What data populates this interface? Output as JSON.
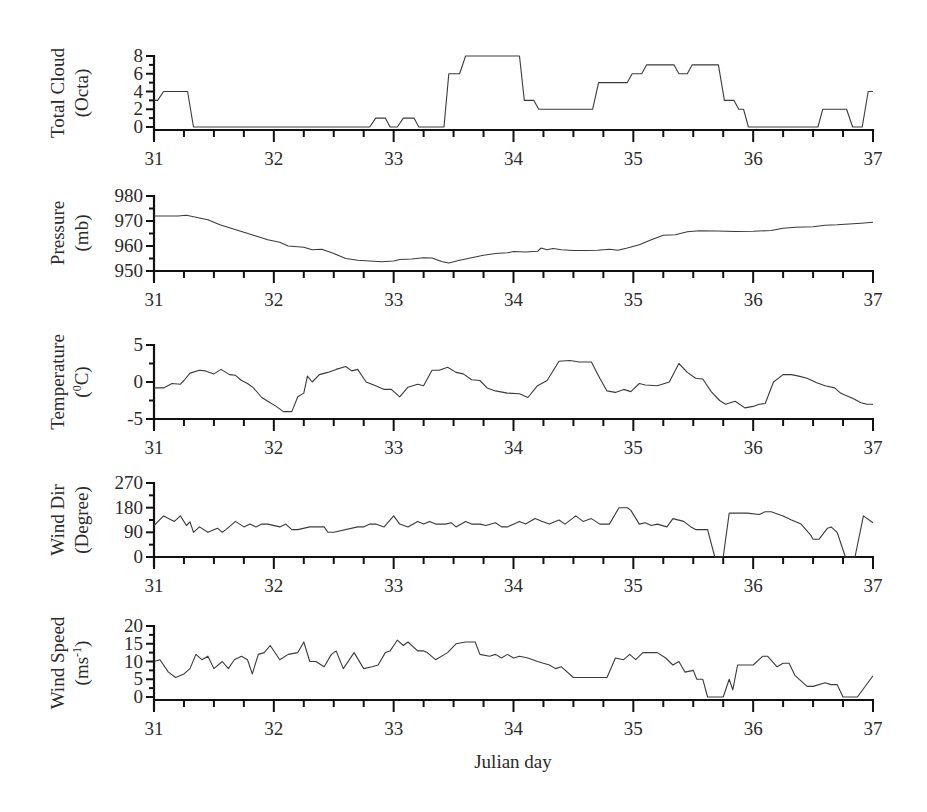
{
  "figure": {
    "xlabel": "Julian day"
  },
  "chart_data": [
    {
      "type": "line",
      "title": "",
      "ylabel_line1": "Total Cloud",
      "ylabel_line2": "(Octa)",
      "xlabel": "",
      "xlim": [
        31,
        37
      ],
      "ylim": [
        0,
        8
      ],
      "yticks": [
        0,
        2,
        4,
        6,
        8
      ],
      "xticks": [
        31,
        32,
        33,
        34,
        35,
        36,
        37
      ],
      "grid": false,
      "series": [
        {
          "name": "Total Cloud",
          "x": [
            31.0,
            31.03,
            31.08,
            31.28,
            31.33,
            32.8,
            32.85,
            32.93,
            32.97,
            33.03,
            33.08,
            33.17,
            33.21,
            33.42,
            33.46,
            33.55,
            33.6,
            34.05,
            34.09,
            34.17,
            34.21,
            34.66,
            34.71,
            34.95,
            34.99,
            35.07,
            35.11,
            35.34,
            35.38,
            35.45,
            35.49,
            35.71,
            35.76,
            35.84,
            35.88,
            35.92,
            35.96,
            36.54,
            36.58,
            36.78,
            36.83,
            36.91,
            36.96,
            37.0
          ],
          "values": [
            3,
            3,
            4,
            4,
            0,
            0,
            1,
            1,
            0,
            0,
            1,
            1,
            0,
            0,
            6,
            6,
            8,
            8,
            3,
            3,
            2,
            2,
            5,
            5,
            6,
            6,
            7,
            7,
            6,
            6,
            7,
            7,
            3,
            3,
            2,
            2,
            0,
            0,
            2,
            2,
            0,
            0,
            4,
            4
          ]
        }
      ]
    },
    {
      "type": "line",
      "title": "",
      "ylabel_line1": "Pressure",
      "ylabel_line2": "(mb)",
      "xlabel": "",
      "xlim": [
        31,
        37
      ],
      "ylim": [
        950,
        980
      ],
      "yticks": [
        950,
        960,
        970,
        980
      ],
      "xticks": [
        31,
        32,
        33,
        34,
        35,
        36,
        37
      ],
      "grid": false,
      "series": [
        {
          "name": "Pressure",
          "x": [
            31.0,
            31.1,
            31.2,
            31.27,
            31.35,
            31.45,
            31.55,
            31.65,
            31.75,
            31.85,
            31.95,
            32.05,
            32.12,
            32.25,
            32.32,
            32.4,
            32.5,
            32.6,
            32.7,
            32.8,
            32.9,
            33.0,
            33.05,
            33.15,
            33.25,
            33.32,
            33.4,
            33.46,
            33.55,
            33.65,
            33.75,
            33.85,
            33.95,
            34.0,
            34.1,
            34.2,
            34.23,
            34.28,
            34.33,
            34.4,
            34.5,
            34.6,
            34.7,
            34.8,
            34.87,
            34.95,
            35.05,
            35.15,
            35.25,
            35.35,
            35.45,
            35.55,
            35.7,
            35.85,
            36.0,
            36.15,
            36.25,
            36.35,
            36.5,
            36.6,
            36.7,
            36.8,
            36.9,
            37.0
          ],
          "values": [
            972,
            972,
            972,
            972.3,
            971.5,
            970.5,
            968.5,
            967,
            965.5,
            964,
            962.5,
            961.5,
            960,
            959.5,
            958.5,
            958.7,
            957,
            955,
            954.3,
            954,
            953.7,
            954,
            954.6,
            954.8,
            955.3,
            955.2,
            953.8,
            953.2,
            954.3,
            955.3,
            956.3,
            957,
            957.3,
            957.8,
            957.6,
            957.9,
            959.2,
            958.5,
            959,
            958.5,
            958.2,
            958.2,
            958.3,
            958.7,
            958.3,
            959.2,
            960.5,
            962.5,
            964.3,
            964.5,
            965.7,
            966.1,
            966,
            965.8,
            965.9,
            966.2,
            967.1,
            967.5,
            967.7,
            968.3,
            968.5,
            968.8,
            969.1,
            969.5
          ]
        }
      ]
    },
    {
      "type": "line",
      "title": "",
      "ylabel_line1": "Temperature",
      "ylabel_line2": "(0C)",
      "ylabel_line2_parts": {
        "open": "(",
        "sup": "0",
        "rest": "C)"
      },
      "xlabel": "",
      "xlim": [
        31,
        37
      ],
      "ylim": [
        -5,
        5
      ],
      "yticks": [
        -5,
        0,
        5
      ],
      "ytick_labels": [
        "-5",
        "0",
        "5"
      ],
      "xticks": [
        31,
        32,
        33,
        34,
        35,
        36,
        37
      ],
      "grid": false,
      "series": [
        {
          "name": "Temperature",
          "x": [
            31.0,
            31.08,
            31.15,
            31.22,
            31.25,
            31.3,
            31.38,
            31.43,
            31.5,
            31.56,
            31.63,
            31.68,
            31.73,
            31.78,
            31.83,
            31.9,
            31.95,
            32.02,
            32.08,
            32.15,
            32.2,
            32.25,
            32.28,
            32.32,
            32.38,
            32.45,
            32.52,
            32.6,
            32.65,
            32.7,
            32.77,
            32.85,
            32.92,
            32.98,
            33.05,
            33.12,
            33.2,
            33.25,
            33.32,
            33.38,
            33.45,
            33.52,
            33.58,
            33.65,
            33.72,
            33.78,
            33.85,
            33.95,
            34.05,
            34.12,
            34.2,
            34.28,
            34.38,
            34.47,
            34.55,
            34.65,
            34.72,
            34.78,
            34.85,
            34.92,
            34.98,
            35.05,
            35.1,
            35.2,
            35.3,
            35.38,
            35.45,
            35.52,
            35.58,
            35.65,
            35.72,
            35.77,
            35.85,
            35.93,
            36.0,
            36.05,
            36.1,
            36.17,
            36.25,
            36.32,
            36.38,
            36.45,
            36.53,
            36.6,
            36.68,
            36.73,
            36.77,
            36.83,
            36.9,
            36.95,
            37.0
          ],
          "values": [
            -0.8,
            -0.8,
            -0.2,
            -0.3,
            0.2,
            1.2,
            1.6,
            1.5,
            1.1,
            1.7,
            1.0,
            0.9,
            0.2,
            -0.2,
            -0.8,
            -2.1,
            -2.6,
            -3.3,
            -4.0,
            -4.0,
            -2.0,
            -1.5,
            0.8,
            0.0,
            1.0,
            1.3,
            1.7,
            2.1,
            1.5,
            1.7,
            0.0,
            -0.5,
            -1.0,
            -1.0,
            -2.0,
            -0.7,
            -0.3,
            -0.5,
            1.6,
            1.6,
            2.0,
            1.3,
            1.1,
            0.3,
            0.2,
            -0.8,
            -1.2,
            -1.5,
            -1.6,
            -2.1,
            -0.5,
            0.2,
            2.8,
            2.9,
            2.7,
            2.7,
            0.5,
            -1.2,
            -1.4,
            -1.0,
            -1.3,
            -0.2,
            -0.4,
            -0.5,
            0.0,
            2.5,
            1.3,
            0.5,
            0.4,
            -1.3,
            -2.5,
            -3.0,
            -2.6,
            -3.5,
            -3.3,
            -3.0,
            -2.9,
            0.0,
            1.0,
            1.0,
            0.8,
            0.5,
            -0.1,
            -0.5,
            -0.8,
            -1.5,
            -1.8,
            -2.2,
            -2.8,
            -3.0,
            -3.0
          ]
        }
      ]
    },
    {
      "type": "line",
      "title": "",
      "ylabel_line1": "Wind Dir",
      "ylabel_line2": "(Degree)",
      "xlabel": "",
      "xlim": [
        31,
        37
      ],
      "ylim": [
        0,
        270
      ],
      "yticks": [
        0,
        90,
        180,
        270
      ],
      "xticks": [
        31,
        32,
        33,
        34,
        35,
        36,
        37
      ],
      "grid": false,
      "series": [
        {
          "name": "Wind Direction",
          "x": [
            31.0,
            31.08,
            31.17,
            31.22,
            31.27,
            31.3,
            31.33,
            31.38,
            31.45,
            31.53,
            31.57,
            31.6,
            31.68,
            31.75,
            31.8,
            31.85,
            31.9,
            31.95,
            32.05,
            32.1,
            32.15,
            32.2,
            32.3,
            32.42,
            32.45,
            32.5,
            32.7,
            32.75,
            32.8,
            32.85,
            32.92,
            33.0,
            33.05,
            33.12,
            33.2,
            33.25,
            33.3,
            33.35,
            33.43,
            33.48,
            33.52,
            33.6,
            33.65,
            33.72,
            33.77,
            33.85,
            33.9,
            33.95,
            34.05,
            34.1,
            34.18,
            34.24,
            34.3,
            34.38,
            34.43,
            34.52,
            34.58,
            34.65,
            34.72,
            34.8,
            34.88,
            34.95,
            34.98,
            35.05,
            35.1,
            35.15,
            35.2,
            35.28,
            35.33,
            35.42,
            35.48,
            35.52,
            35.62,
            35.68,
            35.75,
            35.8,
            35.85,
            35.95,
            36.05,
            36.1,
            36.15,
            36.25,
            36.32,
            36.4,
            36.48,
            36.5,
            36.55,
            36.62,
            36.65,
            36.7,
            36.77,
            36.85,
            36.92,
            37.0
          ],
          "values": [
            115,
            150,
            130,
            150,
            115,
            128,
            90,
            110,
            90,
            105,
            90,
            100,
            130,
            110,
            120,
            110,
            120,
            120,
            110,
            120,
            100,
            100,
            110,
            110,
            90,
            90,
            110,
            110,
            120,
            120,
            110,
            150,
            120,
            110,
            130,
            120,
            130,
            120,
            120,
            125,
            110,
            130,
            120,
            120,
            115,
            125,
            110,
            110,
            130,
            120,
            140,
            130,
            120,
            135,
            120,
            150,
            130,
            140,
            120,
            120,
            180,
            180,
            170,
            120,
            125,
            115,
            120,
            110,
            140,
            130,
            110,
            100,
            100,
            0,
            0,
            160,
            160,
            160,
            155,
            165,
            165,
            150,
            135,
            120,
            80,
            65,
            65,
            105,
            110,
            90,
            0,
            0,
            150,
            125
          ]
        }
      ]
    },
    {
      "type": "line",
      "title": "",
      "ylabel_line1": "Wind Speed",
      "ylabel_line2": "(ms-1)",
      "ylabel_line2_parts": {
        "open": "(ms",
        "sup": "-1",
        "rest": ")"
      },
      "xlabel": "Julian day",
      "xlim": [
        31,
        37
      ],
      "ylim": [
        0,
        20
      ],
      "yticks": [
        0,
        5,
        10,
        15,
        20
      ],
      "xticks": [
        31,
        32,
        33,
        34,
        35,
        36,
        37
      ],
      "grid": false,
      "series": [
        {
          "name": "Wind Speed",
          "x": [
            31.0,
            31.05,
            31.12,
            31.18,
            31.25,
            31.3,
            31.35,
            31.4,
            31.45,
            31.5,
            31.57,
            31.62,
            31.67,
            31.73,
            31.78,
            31.82,
            31.87,
            31.92,
            31.97,
            32.05,
            32.12,
            32.2,
            32.25,
            32.3,
            32.35,
            32.42,
            32.48,
            32.52,
            32.58,
            32.67,
            32.75,
            32.82,
            32.87,
            32.93,
            32.97,
            33.03,
            33.08,
            33.12,
            33.2,
            33.25,
            33.28,
            33.35,
            33.45,
            33.52,
            33.6,
            33.68,
            33.72,
            33.8,
            33.85,
            33.9,
            33.95,
            34.0,
            34.05,
            34.12,
            34.2,
            34.3,
            34.35,
            34.4,
            34.5,
            34.55,
            34.65,
            34.72,
            34.78,
            34.85,
            34.92,
            34.97,
            35.02,
            35.08,
            35.13,
            35.2,
            35.27,
            35.33,
            35.38,
            35.43,
            35.5,
            35.53,
            35.58,
            35.62,
            35.68,
            35.75,
            35.8,
            35.83,
            35.87,
            35.93,
            36.0,
            36.08,
            36.12,
            36.2,
            36.25,
            36.3,
            36.35,
            36.45,
            36.5,
            36.6,
            36.65,
            36.7,
            36.75,
            36.87,
            37.0
          ],
          "values": [
            10,
            10.5,
            7,
            5.5,
            6.5,
            8,
            12,
            10.5,
            11.5,
            8,
            10,
            8,
            10.5,
            11.5,
            10.5,
            6.5,
            12,
            12.5,
            14.5,
            10.5,
            12,
            12.5,
            15.5,
            10,
            10,
            8.5,
            12,
            13,
            8,
            12.5,
            8,
            8.5,
            9,
            12.5,
            13,
            16,
            14.5,
            15.5,
            13,
            13,
            12.5,
            10.5,
            12.5,
            15,
            15.5,
            15.5,
            12,
            11.5,
            12,
            11,
            12,
            11,
            11.5,
            11,
            10,
            9,
            8,
            8.5,
            5.5,
            5.5,
            5.5,
            5.5,
            5.5,
            11,
            10.5,
            12,
            10.5,
            12.5,
            12.5,
            12.5,
            11,
            9,
            10,
            7,
            7.5,
            5,
            5,
            0,
            0,
            0,
            5,
            2,
            9,
            9,
            9,
            11.5,
            11.5,
            8.5,
            9.5,
            9.5,
            6,
            3,
            3,
            4,
            3.5,
            3.5,
            0,
            0,
            6
          ]
        }
      ]
    }
  ]
}
